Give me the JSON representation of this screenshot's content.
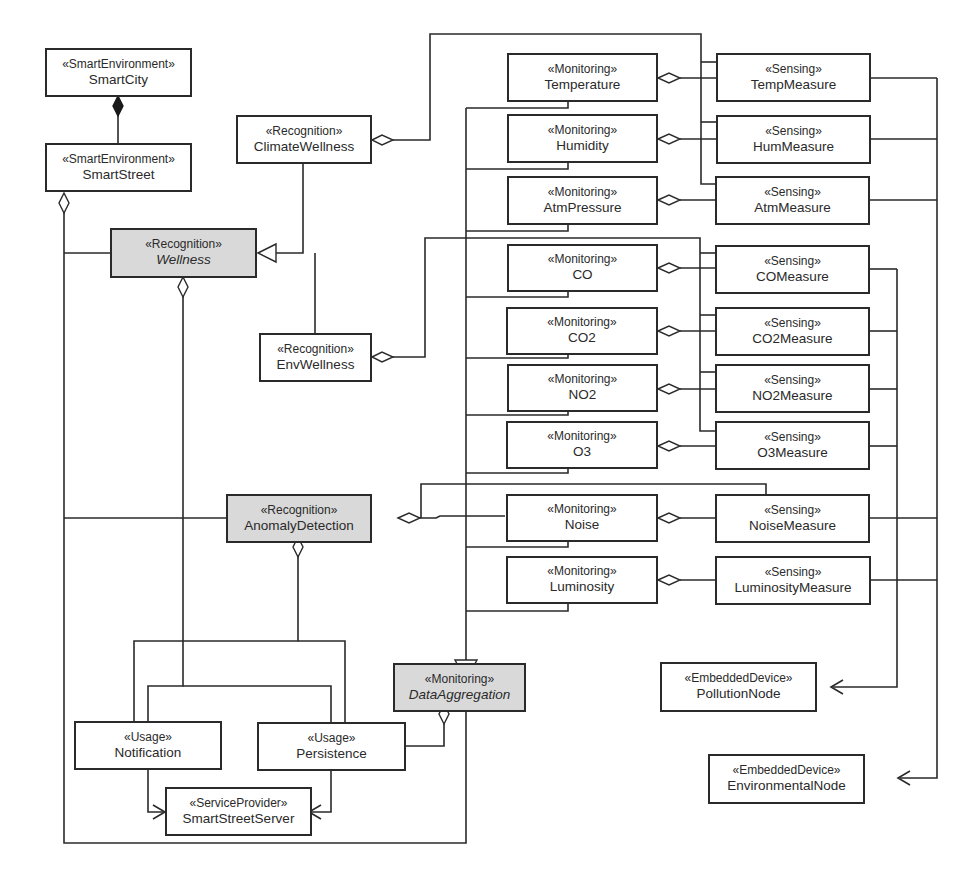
{
  "diagram": {
    "type": "UML class diagram",
    "colors": {
      "line": "#2a2a2a",
      "abstract_fill": "#d9d9d9",
      "class_fill": "#ffffff",
      "background": "#ffffff"
    },
    "nodes": {
      "smartcity": {
        "stereotype": "«SmartEnvironment»",
        "name": "SmartCity"
      },
      "smartstreet": {
        "stereotype": "«SmartEnvironment»",
        "name": "SmartStreet"
      },
      "climatewellness": {
        "stereotype": "«Recognition»",
        "name": "ClimateWellness"
      },
      "wellness": {
        "stereotype": "«Recognition»",
        "name": "Wellness",
        "abstract": true
      },
      "envwellness": {
        "stereotype": "«Recognition»",
        "name": "EnvWellness"
      },
      "anomalydetection": {
        "stereotype": "«Recognition»",
        "name": "AnomalyDetection",
        "highlighted": true
      },
      "notification": {
        "stereotype": "«Usage»",
        "name": "Notification"
      },
      "persistence": {
        "stereotype": "«Usage»",
        "name": "Persistence"
      },
      "smartstreetserver": {
        "stereotype": "«ServiceProvider»",
        "name": "SmartStreetServer"
      },
      "dataaggregation": {
        "stereotype": "«Monitoring»",
        "name": "DataAggregation",
        "abstract": true
      },
      "temperature": {
        "stereotype": "«Monitoring»",
        "name": "Temperature"
      },
      "humidity": {
        "stereotype": "«Monitoring»",
        "name": "Humidity"
      },
      "atmpressure": {
        "stereotype": "«Monitoring»",
        "name": "AtmPressure"
      },
      "co": {
        "stereotype": "«Monitoring»",
        "name": "CO"
      },
      "co2": {
        "stereotype": "«Monitoring»",
        "name": "CO2"
      },
      "no2": {
        "stereotype": "«Monitoring»",
        "name": "NO2"
      },
      "o3": {
        "stereotype": "«Monitoring»",
        "name": "O3"
      },
      "noise": {
        "stereotype": "«Monitoring»",
        "name": "Noise"
      },
      "luminosity": {
        "stereotype": "«Monitoring»",
        "name": "Luminosity"
      },
      "tempmeasure": {
        "stereotype": "«Sensing»",
        "name": "TempMeasure"
      },
      "hummeasure": {
        "stereotype": "«Sensing»",
        "name": "HumMeasure"
      },
      "atmmeasure": {
        "stereotype": "«Sensing»",
        "name": "AtmMeasure"
      },
      "comeasure": {
        "stereotype": "«Sensing»",
        "name": "COMeasure"
      },
      "co2measure": {
        "stereotype": "«Sensing»",
        "name": "CO2Measure"
      },
      "no2measure": {
        "stereotype": "«Sensing»",
        "name": "NO2Measure"
      },
      "o3measure": {
        "stereotype": "«Sensing»",
        "name": "O3Measure"
      },
      "noisemeasure": {
        "stereotype": "«Sensing»",
        "name": "NoiseMeasure"
      },
      "luminositymeasure": {
        "stereotype": "«Sensing»",
        "name": "LuminosityMeasure"
      },
      "pollutionnode": {
        "stereotype": "«EmbeddedDevice»",
        "name": "PollutionNode"
      },
      "environmentalnode": {
        "stereotype": "«EmbeddedDevice»",
        "name": "EnvironmentalNode"
      }
    },
    "relations": [
      {
        "type": "composition",
        "whole": "SmartCity",
        "part": "SmartStreet"
      },
      {
        "type": "aggregation",
        "whole": "SmartStreet",
        "part": "Wellness"
      },
      {
        "type": "aggregation",
        "whole": "SmartStreet",
        "part": "AnomalyDetection"
      },
      {
        "type": "aggregation",
        "whole": "SmartStreet",
        "part": "DataAggregation"
      },
      {
        "type": "generalization",
        "child": "ClimateWellness",
        "parent": "Wellness"
      },
      {
        "type": "generalization",
        "child": "EnvWellness",
        "parent": "Wellness"
      },
      {
        "type": "aggregation",
        "whole": "Wellness",
        "part": "Notification"
      },
      {
        "type": "aggregation",
        "whole": "AnomalyDetection",
        "part": "Notification"
      },
      {
        "type": "aggregation",
        "whole": "AnomalyDetection",
        "part": "Persistence"
      },
      {
        "type": "aggregation",
        "whole": "DataAggregation",
        "part": "Persistence"
      },
      {
        "type": "dependency",
        "from": "Notification",
        "to": "SmartStreetServer"
      },
      {
        "type": "dependency",
        "from": "Persistence",
        "to": "SmartStreetServer"
      },
      {
        "type": "aggregation",
        "whole": "ClimateWellness",
        "part": [
          "TempMeasure",
          "HumMeasure",
          "AtmMeasure"
        ]
      },
      {
        "type": "aggregation",
        "whole": "EnvWellness",
        "part": [
          "COMeasure",
          "CO2Measure",
          "NO2Measure",
          "O3Measure"
        ]
      },
      {
        "type": "aggregation",
        "whole": "AnomalyDetection",
        "part": [
          "Noise",
          "NoiseMeasure"
        ]
      },
      {
        "type": "aggregation",
        "whole": "Temperature",
        "part": "TempMeasure"
      },
      {
        "type": "aggregation",
        "whole": "Humidity",
        "part": "HumMeasure"
      },
      {
        "type": "aggregation",
        "whole": "AtmPressure",
        "part": "AtmMeasure"
      },
      {
        "type": "aggregation",
        "whole": "CO",
        "part": "COMeasure"
      },
      {
        "type": "aggregation",
        "whole": "CO2",
        "part": "CO2Measure"
      },
      {
        "type": "aggregation",
        "whole": "NO2",
        "part": "NO2Measure"
      },
      {
        "type": "aggregation",
        "whole": "O3",
        "part": "O3Measure"
      },
      {
        "type": "aggregation",
        "whole": "Noise",
        "part": "NoiseMeasure"
      },
      {
        "type": "aggregation",
        "whole": "Luminosity",
        "part": "LuminosityMeasure"
      },
      {
        "type": "generalization",
        "child": [
          "Temperature",
          "Humidity",
          "AtmPressure",
          "CO",
          "CO2",
          "NO2",
          "O3",
          "Noise",
          "Luminosity"
        ],
        "parent": "DataAggregation"
      },
      {
        "type": "dependency",
        "from": [
          "COMeasure",
          "CO2Measure",
          "NO2Measure",
          "O3Measure",
          "NoiseMeasure",
          "LuminosityMeasure"
        ],
        "to": "PollutionNode"
      },
      {
        "type": "dependency",
        "from": [
          "TempMeasure",
          "HumMeasure",
          "AtmMeasure",
          "NoiseMeasure",
          "LuminosityMeasure"
        ],
        "to": "EnvironmentalNode"
      }
    ]
  }
}
